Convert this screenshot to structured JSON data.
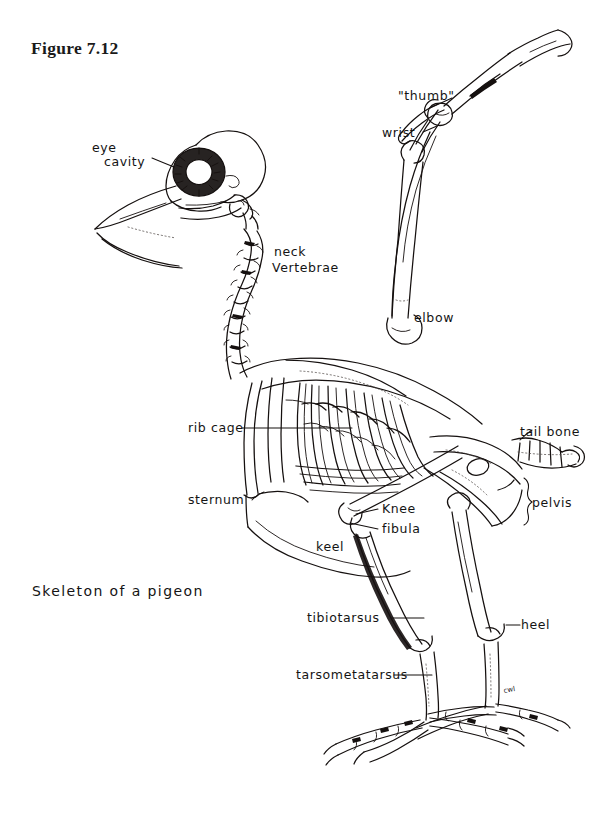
{
  "figure": {
    "number_label": "Figure 7.12",
    "caption": "Skeleton of a pigeon",
    "artist_signature": "cwl",
    "ink_color": "#15100f",
    "background_color": "#ffffff"
  },
  "labels": {
    "eye_cavity_line1": "eye",
    "eye_cavity_line2": "cavity",
    "neck_line1": "neck",
    "neck_line2": "Vertebrae",
    "thumb": "\"thumb\"",
    "wrist": "wrist",
    "elbow": "elbow",
    "rib_cage": "rib cage",
    "sternum": "sternum",
    "keel": "keel",
    "tail_bone": "tail bone",
    "pelvis": "pelvis",
    "knee": "Knee",
    "fibula": "fibula",
    "tibiotarsus": "tibiotarsus",
    "heel": "heel",
    "tarsometatarsus": "tarsometatarsus"
  }
}
